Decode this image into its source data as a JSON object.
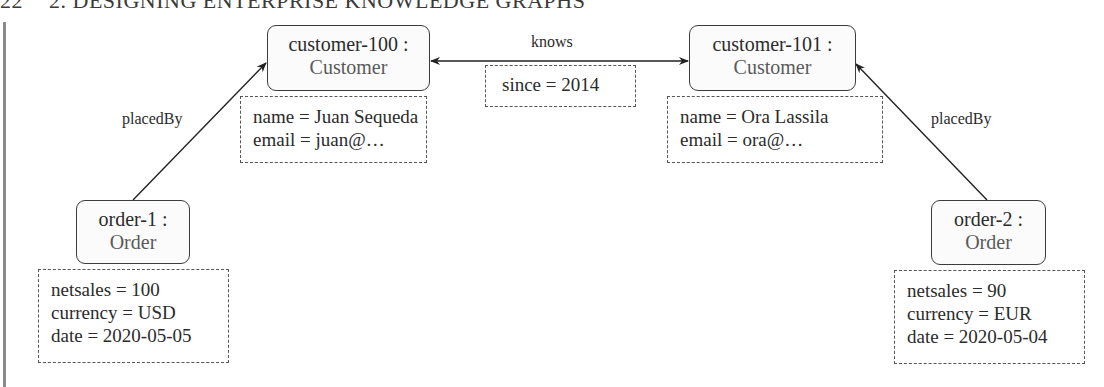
{
  "running_head": {
    "page_number": "22",
    "chapter": "2. DESIGNING ENTERPRISE KNOWLEDGE GRAPHS"
  },
  "nodes": {
    "customer_100": {
      "instance": "customer-100 :",
      "class": "Customer"
    },
    "customer_101": {
      "instance": "customer-101 :",
      "class": "Customer"
    },
    "order_1": {
      "instance": "order-1 :",
      "class": "Order"
    },
    "order_2": {
      "instance": "order-2 :",
      "class": "Order"
    }
  },
  "attributes": {
    "customer_100": [
      "name = Juan Sequeda",
      "email = juan@…"
    ],
    "customer_101": [
      "name = Ora Lassila",
      "email = ora@…"
    ],
    "knows_edge": [
      "since = 2014"
    ],
    "order_1": [
      "netsales = 100",
      "currency = USD",
      "date = 2020-05-05"
    ],
    "order_2": [
      "netsales = 90",
      "currency = EUR",
      "date = 2020-05-04"
    ]
  },
  "edges": {
    "knows": {
      "label": "knows",
      "from": "customer-100",
      "to": "customer-101",
      "direction": "bidirectional"
    },
    "placed_by_1": {
      "label": "placedBy",
      "from": "order-1",
      "to": "customer-100"
    },
    "placed_by_2": {
      "label": "placedBy",
      "from": "order-2",
      "to": "customer-101"
    }
  }
}
